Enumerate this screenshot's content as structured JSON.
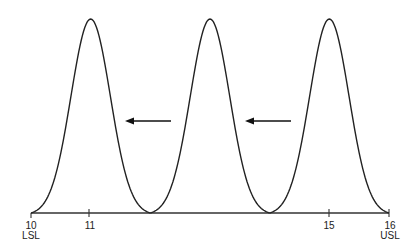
{
  "figure": {
    "type": "diagram",
    "axis": {
      "min": 10,
      "max": 16,
      "ticks": [
        {
          "value": "10",
          "sublabel": "LSL"
        },
        {
          "value": "11",
          "sublabel": ""
        },
        {
          "value": "15",
          "sublabel": ""
        },
        {
          "value": "16",
          "sublabel": "USL"
        }
      ]
    },
    "distributions": [
      {
        "name": "left",
        "mean": 11
      },
      {
        "name": "middle",
        "mean": 13
      },
      {
        "name": "right",
        "mean": 15
      }
    ],
    "arrows": [
      {
        "name": "shift-arrow-1",
        "direction": "left"
      },
      {
        "name": "shift-arrow-2",
        "direction": "left"
      }
    ],
    "colors": {
      "stroke": "#222222",
      "background": "#ffffff"
    }
  }
}
